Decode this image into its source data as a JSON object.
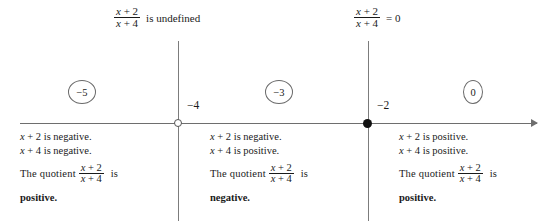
{
  "expression": {
    "numerator_var": "x",
    "numerator": "x + 2",
    "denominator": "x + 4",
    "num_var": "x",
    "num_rest": " + 2",
    "den_var": "x",
    "den_rest": " + 4"
  },
  "top_labels": [
    {
      "name": "undefined-label",
      "numerator_var": "x",
      "numerator_rest": " + 2",
      "denominator_var": "x",
      "denominator_rest": " + 4",
      "tail": "is undefined"
    },
    {
      "name": "zero-label",
      "numerator_var": "x",
      "numerator_rest": " + 2",
      "denominator_var": "x",
      "denominator_rest": " + 4",
      "tail": "= 0"
    }
  ],
  "number_line": {
    "points": [
      {
        "value": "−4",
        "marker": "open",
        "label": "−4"
      },
      {
        "value": "−2",
        "marker": "closed",
        "label": "−2"
      }
    ],
    "test_values": [
      {
        "label": "−5"
      },
      {
        "label": "−3"
      },
      {
        "label": "0"
      }
    ]
  },
  "intervals": [
    {
      "name": "interval-left",
      "line1": "x + 2 is negative.",
      "line1_var": "x",
      "line1_rest": " + 2 is negative.",
      "line2_var": "x",
      "line2_rest": " + 4 is negative.",
      "quotient_lead": "The  quotient",
      "quotient_num_var": "x",
      "quotient_num_rest": " + 2",
      "quotient_den_var": "x",
      "quotient_den_rest": " + 4",
      "quotient_tail": "is",
      "verdict": "positive."
    },
    {
      "name": "interval-middle",
      "line1_var": "x",
      "line1_rest": " + 2 is negative.",
      "line2_var": "x",
      "line2_rest": " + 4 is positive.",
      "quotient_lead": "The  quotient",
      "quotient_num_var": "x",
      "quotient_num_rest": " + 2",
      "quotient_den_var": "x",
      "quotient_den_rest": " + 4",
      "quotient_tail": "is",
      "verdict": "negative."
    },
    {
      "name": "interval-right",
      "line1_var": "x",
      "line1_rest": " + 2 is positive.",
      "line2_var": "x",
      "line2_rest": " + 4 is positive.",
      "quotient_lead": "The  quotient",
      "quotient_num_var": "x",
      "quotient_num_rest": " + 2",
      "quotient_den_var": "x",
      "quotient_den_rest": " + 4",
      "quotient_tail": "is",
      "verdict": "positive."
    }
  ],
  "colors": {
    "ink": "#1a1a1a",
    "line": "#6e6e6e",
    "divider": "#7c7c7c"
  }
}
